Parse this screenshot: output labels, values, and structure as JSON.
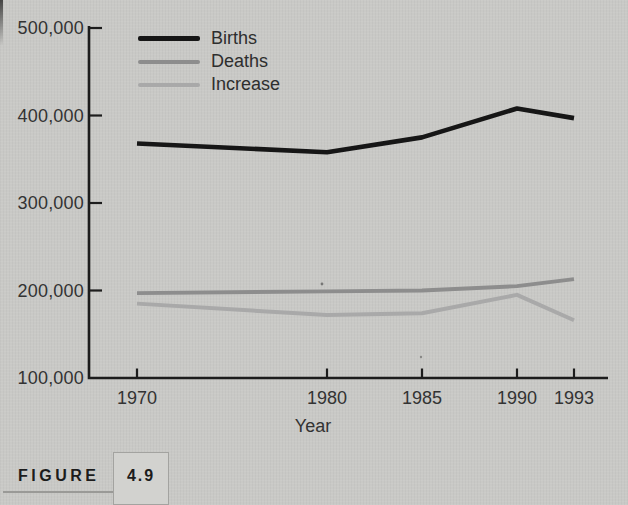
{
  "figure": {
    "label": "FIGURE",
    "number": "4.9"
  },
  "chart_data": {
    "type": "line",
    "title": "",
    "xlabel": "Year",
    "ylabel": "",
    "x": [
      1970,
      1980,
      1985,
      1990,
      1993
    ],
    "x_tick_labels": [
      "1970",
      "1980",
      "1985",
      "1990",
      "1993"
    ],
    "y_ticks": [
      100000,
      200000,
      300000,
      400000,
      500000
    ],
    "y_tick_labels": [
      "100,000",
      "200,000",
      "300,000",
      "400,000",
      "500,000"
    ],
    "ylim": [
      100000,
      500000
    ],
    "xlim": [
      1967.5,
      1994.8
    ],
    "grid": false,
    "legend_position": "top-left-inside",
    "series": [
      {
        "name": "Births",
        "color": "#161616",
        "width": 4.6,
        "values": [
          368000,
          358000,
          375000,
          408000,
          397000
        ]
      },
      {
        "name": "Deaths",
        "color": "#8d8d8d",
        "width": 4.0,
        "values": [
          197000,
          199000,
          200000,
          205000,
          213000
        ]
      },
      {
        "name": "Increase",
        "color": "#a9a9a9",
        "width": 4.0,
        "values": [
          185000,
          172000,
          174000,
          195000,
          166000
        ]
      }
    ]
  },
  "colors": {
    "background": "#c9c9c6",
    "axis": "#1c1c1c",
    "tick_text": "#333333",
    "caption_text": "#1c1c1c",
    "caption_box_fill": "#d2d2cf",
    "caption_box_border": "#a3a3a0",
    "caption_rule": "#9a9a97"
  }
}
